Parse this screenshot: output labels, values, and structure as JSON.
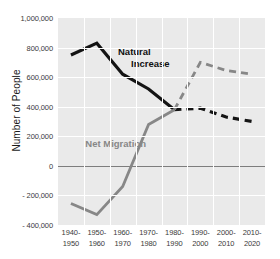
{
  "chart_data": {
    "type": "line",
    "title": "",
    "xlabel": "",
    "ylabel": "Number of People",
    "ylim": [
      -400000,
      1000000
    ],
    "ytick_labels": [
      "1,000,000",
      "800,000",
      "600,000",
      "400,000",
      "200,000",
      "0",
      "- 200,000",
      "- 400,000"
    ],
    "ytick_values": [
      1000000,
      800000,
      600000,
      400000,
      200000,
      0,
      -200000,
      -400000
    ],
    "grid": true,
    "legend_position": "inline-annotations",
    "categories": [
      "1940-1950",
      "1950-1960",
      "1960-1970",
      "1970-1980",
      "1980-1990",
      "1990-2000",
      "2000-2010",
      "2010-2020"
    ],
    "category_lines": [
      [
        "1940-",
        "1950"
      ],
      [
        "1950-",
        "1960"
      ],
      [
        "1960-",
        "1970"
      ],
      [
        "1970-",
        "1980"
      ],
      [
        "1980-",
        "1990"
      ],
      [
        "1990-",
        "2000"
      ],
      [
        "2000-",
        "2010"
      ],
      [
        "2010-",
        "2020"
      ]
    ],
    "series": [
      {
        "name": "Natural Increase",
        "color": "#141414",
        "values": [
          750000,
          830000,
          620000,
          520000,
          380000,
          390000,
          330000,
          300000
        ],
        "solid_through_index": 4,
        "dashed_from_index": 4,
        "annotation": {
          "line1": "Natural",
          "line2": "Increase"
        }
      },
      {
        "name": "Net Migration",
        "color": "#878787",
        "values": [
          -255000,
          -330000,
          -140000,
          280000,
          380000,
          700000,
          645000,
          620000
        ],
        "solid_through_index": 4,
        "dashed_from_index": 4,
        "annotation": {
          "line1": "Net",
          "line2": "Migration"
        }
      }
    ]
  },
  "colors": {
    "plot_background": "#eaeaea",
    "gridline": "#ffffff",
    "zero_line": "#7d7d7d",
    "natural_increase": "#141414",
    "net_migration": "#878787",
    "tick_text": "#3a3a3a",
    "axis_title_text": "#1a1a1a"
  }
}
